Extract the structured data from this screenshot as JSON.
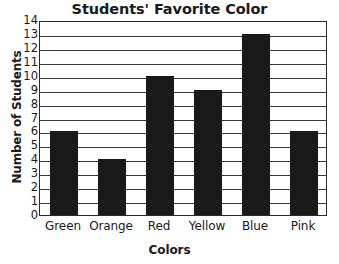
{
  "chart_data": {
    "type": "bar",
    "title": "Students' Favorite Color",
    "xlabel": "Colors",
    "ylabel": "Number of Students",
    "categories": [
      "Green",
      "Orange",
      "Red",
      "Yellow",
      "Blue",
      "Pink"
    ],
    "values": [
      6,
      4,
      10,
      9,
      13,
      6
    ],
    "ylim": [
      0,
      14
    ],
    "ytick_step": 1,
    "yticks": [
      "0",
      "1",
      "2",
      "3",
      "4",
      "5",
      "6",
      "7",
      "8",
      "9",
      "10",
      "11",
      "12",
      "13",
      "14"
    ],
    "grid": "horizontal",
    "legend": "none",
    "bar_color": "#1a1a1a",
    "grid_color": "#3a3a3a",
    "axis_color": "#2b2b2b",
    "background_color": "#ffffff"
  }
}
